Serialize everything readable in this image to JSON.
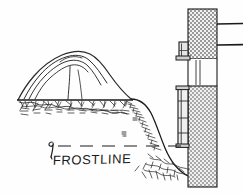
{
  "drawing": {
    "title": "Frostline mulch mound at foundation wall — section sketch",
    "style": "hand-drawn pen-and-ink architectural section",
    "background_color": "#fefefe",
    "ink_color": "#1a1a1a",
    "width": 243,
    "height": 194
  },
  "labels": {
    "frostline": "FROSTLINE"
  },
  "annotations": {
    "frostline_leader": {
      "name": "leader-hook",
      "description": "small hooked leader mark pointing up to the dashed frostline"
    },
    "frostline_dash": {
      "name": "frostline-dashed-line",
      "description": "horizontal dashed line indicating depth of frost penetration",
      "y": 146
    }
  },
  "elements": {
    "mound": {
      "name": "mulch-mound",
      "description": "rounded mound of mulch / soil heaped above grade with layered contour lines",
      "contour_line_count": 4
    },
    "ground": {
      "name": "ground-soil-hatch",
      "description": "hand-hatched earth section below grade line sloping down toward wall footing"
    },
    "grade_line": {
      "name": "grade-line",
      "description": "straight horizontal grade line under the mound"
    },
    "wall": {
      "name": "foundation-wall",
      "description": "vertical cross-hatched masonry foundation wall at right side of section",
      "pattern": "cross-hatch / stipple",
      "fill_color": "#b8b8b8"
    },
    "wall_gap": {
      "name": "wall-course-gap",
      "description": "light horizontal band separating upper and lower wall courses"
    },
    "flashing_upper": {
      "name": "upper-flashing-bracket",
      "description": "small rectangular bracket / flashing attached to left face of upper wall"
    },
    "flashing_lower": {
      "name": "lower-flashing-panel",
      "description": "tall rectangular panel / insulation board attached to left face of lower wall"
    },
    "siding_lines": {
      "name": "siding-course-lines",
      "description": "two horizontal lines extending right from wall indicating siding or floor courses",
      "count": 2
    }
  },
  "colors": {
    "ink": "#1a1a1a",
    "wall_fill": "#b9b9b9",
    "wall_fill_light": "#d8d8d8",
    "paper": "#fefefe"
  }
}
